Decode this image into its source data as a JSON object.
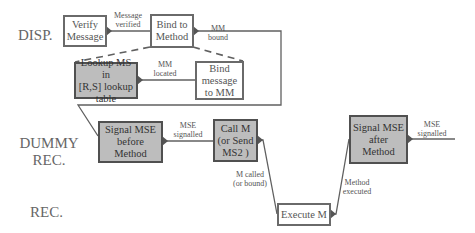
{
  "diagram": {
    "lanes": [
      {
        "id": "disp",
        "label": "DISP."
      },
      {
        "id": "dummy_rec",
        "label_line1": "DUMMY",
        "label_line2": "REC."
      },
      {
        "id": "rec",
        "label": "REC."
      }
    ],
    "nodes": {
      "verify_message": {
        "line1": "Verify",
        "line2": "Message",
        "shaded": false
      },
      "bind_to_method": {
        "line1": "Bind to",
        "line2": "Method",
        "shaded": false
      },
      "lookup_ms": {
        "line1": "Lookup MS in",
        "line2": "[R,S] lookup",
        "line3": "table",
        "shaded": true
      },
      "bind_message_to_mm": {
        "line1": "Bind",
        "line2": "message",
        "line3": "to MM",
        "shaded": false
      },
      "signal_mse_before": {
        "line1": "Signal MSE",
        "line2": "before",
        "line3": "Method",
        "shaded": true
      },
      "call_m": {
        "line1": "Call M",
        "line2": "(or Send",
        "line3": "MS2 )",
        "shaded": true
      },
      "execute_m": {
        "line1": "Execute M",
        "shaded": false
      },
      "signal_mse_after": {
        "line1": "Signal MSE",
        "line2": "after",
        "line3": "Method",
        "shaded": true
      }
    },
    "edge_labels": {
      "message_verified": {
        "line1": "Message",
        "line2": "verified"
      },
      "mm_bound": {
        "line1": "MM",
        "line2": "bound"
      },
      "mm_located": {
        "line1": "MM",
        "line2": "located"
      },
      "mse_signalled_1": {
        "line1": "MSE",
        "line2": "signalled"
      },
      "m_called": {
        "line1": "M called",
        "line2": "(or bound)"
      },
      "method_executed": {
        "line1": "Method",
        "line2": "executed"
      },
      "mse_signalled_2": {
        "line1": "MSE",
        "line2": "signalled"
      }
    },
    "colors": {
      "line": "#606060",
      "shade": "#bdbdbd",
      "text": "#555555"
    }
  }
}
